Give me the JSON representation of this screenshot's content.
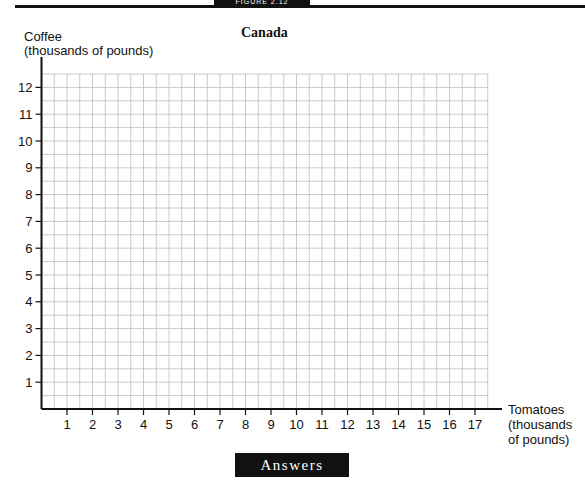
{
  "header": {
    "figure_banner": "FIGURE 2.12"
  },
  "chart_data": {
    "type": "scatter",
    "title": "Canada",
    "xlabel": "Tomatoes (thousands of pounds)",
    "ylabel": "Coffee (thousands of pounds)",
    "xlabel_lines": [
      "Tomatoes",
      "(thousands",
      "of pounds)"
    ],
    "ylabel_lines": [
      "Coffee",
      "(thousands of pounds)"
    ],
    "x_ticks": [
      1,
      2,
      3,
      4,
      5,
      6,
      7,
      8,
      9,
      10,
      11,
      12,
      13,
      14,
      15,
      16,
      17
    ],
    "y_ticks": [
      1,
      2,
      3,
      4,
      5,
      6,
      7,
      8,
      9,
      10,
      11,
      12
    ],
    "xlim": [
      0,
      17.5
    ],
    "ylim": [
      0,
      12.5
    ],
    "grid": true,
    "grid_minor_step": 0.5,
    "series": [],
    "note": "Blank grid for plotting; no data points shown"
  },
  "footer": {
    "answers_label": "Answers"
  }
}
